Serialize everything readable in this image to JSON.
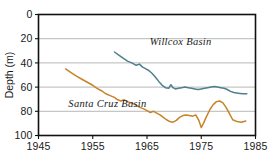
{
  "chart_data": {
    "type": "line",
    "title": "",
    "xlabel": "",
    "ylabel": "Depth (m)",
    "xlim": [
      1945,
      1985
    ],
    "ylim": [
      0,
      100
    ],
    "y_inverted": true,
    "grid": true,
    "legend_position": "inline-annotations",
    "x_ticks": [
      "1945",
      "1955",
      "1965",
      "1975",
      "1985"
    ],
    "x_tick_values": [
      1945,
      1955,
      1965,
      1975,
      1985
    ],
    "y_ticks": [
      "0",
      "20",
      "40",
      "60",
      "80",
      "100"
    ],
    "y_tick_values": [
      0,
      20,
      40,
      60,
      80,
      100
    ],
    "series": [
      {
        "name": "Willcox Basin",
        "color": "#4f7f8c",
        "label_x": 1965.5,
        "label_y": 25.5,
        "x": [
          1959.0,
          1959.8,
          1960.6,
          1961.4,
          1962.2,
          1963.0,
          1963.6,
          1964.2,
          1964.8,
          1965.4,
          1966.0,
          1966.6,
          1967.2,
          1967.8,
          1968.4,
          1969.0,
          1969.4,
          1969.8,
          1970.2,
          1970.8,
          1971.4,
          1972.0,
          1972.6,
          1973.2,
          1973.8,
          1974.4,
          1975.0,
          1975.6,
          1976.2,
          1976.8,
          1977.4,
          1978.0,
          1978.6,
          1979.2,
          1979.8,
          1980.4,
          1981.0,
          1981.8,
          1982.6,
          1983.4
        ],
        "y": [
          31.0,
          33.5,
          36.0,
          38.5,
          40.0,
          42.0,
          41.0,
          43.5,
          45.0,
          46.5,
          49.0,
          52.0,
          55.5,
          58.5,
          60.5,
          61.0,
          58.0,
          60.5,
          61.5,
          61.0,
          60.5,
          60.0,
          60.5,
          61.0,
          61.5,
          62.0,
          61.5,
          61.0,
          60.5,
          60.0,
          59.5,
          60.0,
          60.5,
          61.0,
          62.0,
          63.5,
          64.5,
          65.0,
          65.5,
          65.5
        ]
      },
      {
        "name": "Santa Cruz Basin",
        "color": "#c8822a",
        "label_x": 1950.5,
        "label_y": 76.5,
        "x": [
          1950.0,
          1951.0,
          1952.0,
          1953.0,
          1954.0,
          1955.0,
          1955.8,
          1956.6,
          1957.4,
          1958.2,
          1959.0,
          1959.6,
          1960.2,
          1960.8,
          1961.4,
          1962.0,
          1962.6,
          1963.2,
          1963.8,
          1964.4,
          1965.0,
          1965.6,
          1966.2,
          1966.8,
          1967.4,
          1968.0,
          1968.6,
          1969.2,
          1969.8,
          1970.4,
          1971.0,
          1971.6,
          1972.2,
          1972.8,
          1973.4,
          1974.0,
          1974.6,
          1975.0,
          1975.4,
          1976.0,
          1976.6,
          1977.2,
          1977.8,
          1978.4,
          1979.0,
          1979.6,
          1980.2,
          1980.8,
          1981.6,
          1982.4,
          1983.2
        ],
        "y": [
          45.0,
          48.0,
          51.0,
          53.5,
          56.0,
          58.5,
          61.0,
          63.0,
          65.5,
          67.0,
          68.5,
          70.5,
          71.5,
          70.5,
          72.0,
          73.0,
          74.0,
          75.5,
          77.0,
          78.0,
          79.5,
          81.0,
          80.0,
          81.5,
          83.0,
          85.0,
          87.0,
          88.5,
          89.0,
          87.5,
          85.0,
          83.5,
          83.0,
          83.5,
          84.0,
          83.0,
          88.0,
          93.5,
          90.0,
          84.0,
          78.5,
          74.5,
          72.0,
          71.5,
          73.0,
          77.0,
          82.0,
          87.0,
          88.5,
          89.0,
          88.0
        ]
      }
    ]
  },
  "axis": {
    "y_title": "Depth (m)"
  }
}
